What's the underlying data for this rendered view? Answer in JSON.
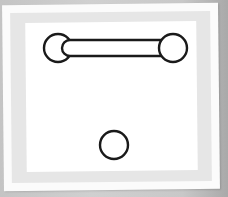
{
  "figure": {
    "colors": {
      "background": "#bdbdbd",
      "card": "#fbfbfb",
      "band": "#e6e6e6",
      "panel": "#ffffff",
      "stroke": "#1a1a1a"
    },
    "shapes": {
      "left_circle": {
        "cx": 58,
        "cy": 48,
        "r": 14
      },
      "right_circle": {
        "cx": 173,
        "cy": 48,
        "r": 14
      },
      "bar": {
        "x1": 62,
        "x2": 162,
        "y": 48,
        "height": 16
      },
      "bottom_circle": {
        "cx": 114,
        "cy": 145,
        "r": 14
      }
    }
  }
}
